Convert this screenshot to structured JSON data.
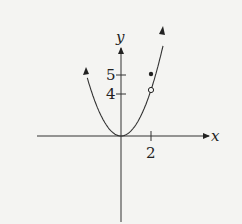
{
  "chart_data": {
    "type": "line",
    "title": "",
    "xlabel": "x",
    "ylabel": "y",
    "function": "y = x^2 for x != 2, with point (2,5)",
    "x_ticks": [
      {
        "value": 2,
        "label": "2"
      }
    ],
    "y_ticks": [
      {
        "value": 4,
        "label": "4"
      },
      {
        "value": 5,
        "label": "5"
      }
    ],
    "series": [
      {
        "name": "f(x)",
        "x": [
          -2.3,
          -2,
          -1,
          0,
          1,
          2,
          2.85
        ],
        "y": [
          5.3,
          4,
          1,
          0,
          1,
          4,
          9.5
        ]
      }
    ],
    "points": [
      {
        "x": 2,
        "y": 4,
        "style": "open-circle"
      },
      {
        "x": 2,
        "y": 5,
        "style": "filled-dot"
      }
    ],
    "grid": false,
    "legend": "none"
  },
  "labels": {
    "x_axis": "x",
    "y_axis": "y",
    "tick_x_2": "2",
    "tick_y_4": "4",
    "tick_y_5": "5"
  },
  "colors": {
    "ink": "#222222",
    "background": "#f4f4f2"
  }
}
